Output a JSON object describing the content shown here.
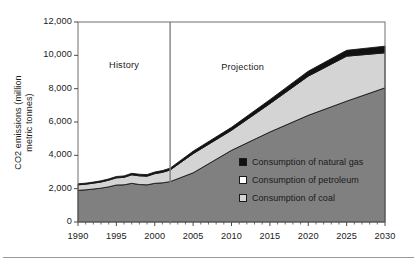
{
  "chart_data": {
    "type": "area",
    "stacked": true,
    "title": "",
    "xlabel": "",
    "ylabel": "CO2 emissions (million metric tonnes)",
    "xlim": [
      1990,
      2030
    ],
    "ylim": [
      0,
      12000
    ],
    "ytick_values": [
      0,
      2000,
      4000,
      6000,
      8000,
      10000,
      12000
    ],
    "ytick_labels": [
      "0",
      "2,000",
      "4,000",
      "6,000",
      "8,000",
      "10,000",
      "12,000"
    ],
    "xtick_values": [
      1990,
      1995,
      2000,
      2005,
      2010,
      2015,
      2020,
      2025,
      2030
    ],
    "xtick_labels": [
      "1990",
      "1995",
      "2000",
      "2005",
      "2010",
      "2015",
      "2020",
      "2025",
      "2030"
    ],
    "minor_xticks": "annual",
    "grid": false,
    "legend_position": "inside-center-right",
    "x": [
      1990,
      1991,
      1992,
      1993,
      1994,
      1995,
      1996,
      1997,
      1998,
      1999,
      2000,
      2001,
      2002,
      2005,
      2010,
      2015,
      2020,
      2025,
      2030
    ],
    "series": [
      {
        "name": "Consumption of coal",
        "color": "#808080",
        "values": [
          1900,
          1930,
          1980,
          2030,
          2110,
          2220,
          2230,
          2320,
          2250,
          2230,
          2320,
          2350,
          2420,
          2950,
          4300,
          5400,
          6400,
          7250,
          8050
        ]
      },
      {
        "name": "Consumption of petroleum",
        "color": "#d4d4d4",
        "values": [
          330,
          340,
          350,
          370,
          400,
          430,
          450,
          510,
          520,
          520,
          580,
          630,
          700,
          1150,
          1200,
          1700,
          2350,
          2700,
          2100
        ]
      },
      {
        "name": "Consumption of natural gas",
        "color": "#111111",
        "values": [
          60,
          60,
          65,
          70,
          75,
          80,
          85,
          90,
          95,
          95,
          100,
          105,
          110,
          150,
          180,
          240,
          300,
          350,
          400
        ]
      }
    ],
    "cumulative_totals": [
      2290,
      2330,
      2395,
      2470,
      2585,
      2730,
      2765,
      2920,
      2865,
      2845,
      3000,
      3085,
      3230,
      4250,
      5680,
      7340,
      9050,
      10300,
      10550
    ],
    "annotations": [
      {
        "label": "History",
        "x_range": [
          1990,
          2002
        ]
      },
      {
        "label": "Projection",
        "x_range": [
          2002,
          2030
        ]
      }
    ],
    "divider": {
      "x": 2002,
      "color": "#808080"
    }
  },
  "chart": {
    "region_history_label": "History",
    "region_projection_label": "Projection",
    "y_axis_title_line1": "CO2 emissions (million",
    "y_axis_title_line2": "metric tonnes)"
  },
  "legend": {
    "items": [
      {
        "label": "Consumption of natural gas",
        "swatch": "#111111",
        "name": "legend-natural-gas"
      },
      {
        "label": "Consumption of petroleum",
        "swatch": "#ffffff",
        "name": "legend-petroleum"
      },
      {
        "label": "Consumption of coal",
        "swatch": "#d4d4d4",
        "name": "legend-coal"
      }
    ]
  },
  "colors": {
    "coal": "#808080",
    "petroleum": "#d4d4d4",
    "natural_gas": "#111111",
    "frame": "#6e6e6e",
    "divider": "#808080",
    "text": "#1a1a1a"
  }
}
